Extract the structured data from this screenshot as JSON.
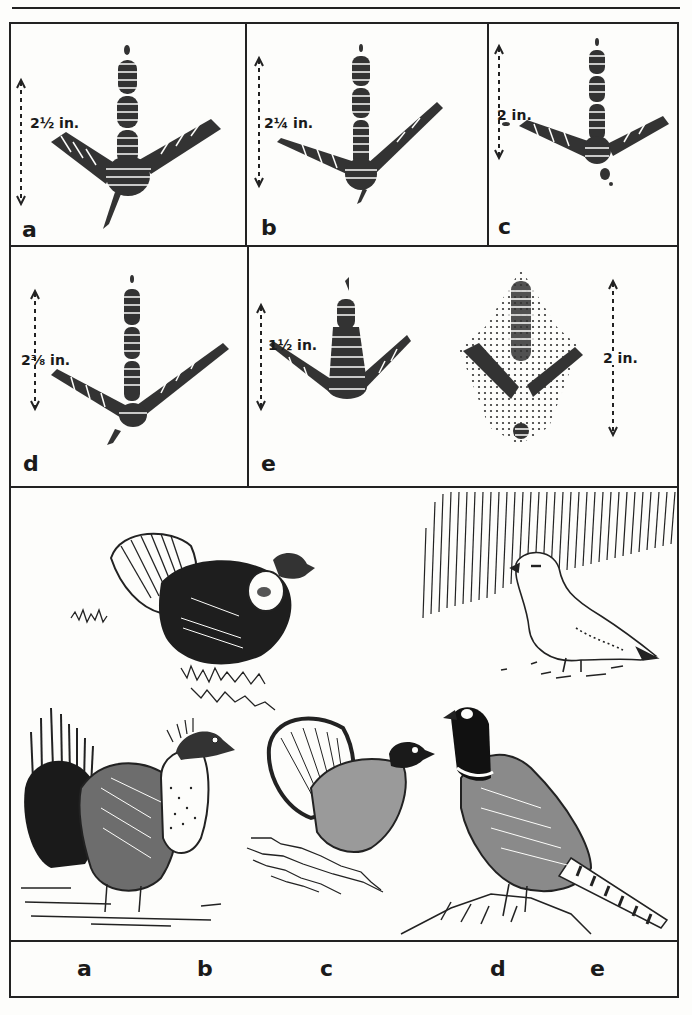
{
  "figure": {
    "track_panels": [
      {
        "id": "a",
        "letter": "a",
        "measurement": "2½ in."
      },
      {
        "id": "b",
        "letter": "b",
        "measurement": "2¼ in."
      },
      {
        "id": "c",
        "letter": "c",
        "measurement": "2 in."
      },
      {
        "id": "d",
        "letter": "d",
        "measurement": "2⅜ in."
      },
      {
        "id": "e",
        "letter": "e",
        "measurement": "1½ in.",
        "second_measurement": "2 in."
      }
    ],
    "illustrations": {
      "description": "Line drawings of five game birds",
      "birds": [
        {
          "letter": "a",
          "subject": "sage grouse"
        },
        {
          "letter": "b",
          "subject": "sharp-tailed grouse / prairie chicken"
        },
        {
          "letter": "c",
          "subject": "ruffed grouse"
        },
        {
          "letter": "d",
          "subject": "ring-necked pheasant"
        },
        {
          "letter": "e",
          "subject": "ptarmigan"
        }
      ]
    },
    "bottom_labels": [
      "a",
      "b",
      "c",
      "d",
      "e"
    ]
  },
  "colors": {
    "ink": "#222222",
    "paper": "#fdfdfb"
  }
}
